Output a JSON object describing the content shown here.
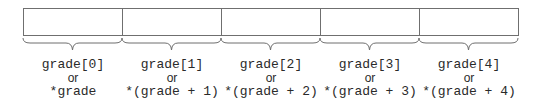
{
  "diagram": {
    "title": "",
    "array_name": "grade",
    "connector": "or",
    "cells": [
      {
        "index": 0,
        "subscript": "grade[0]",
        "pointer": "*grade"
      },
      {
        "index": 1,
        "subscript": "grade[1]",
        "pointer": "*(grade + 1)"
      },
      {
        "index": 2,
        "subscript": "grade[2]",
        "pointer": "*(grade + 2)"
      },
      {
        "index": 3,
        "subscript": "grade[3]",
        "pointer": "*(grade + 3)"
      },
      {
        "index": 4,
        "subscript": "grade[4]",
        "pointer": "*(grade + 4)"
      }
    ],
    "colors": {
      "stroke": "#6f6f6f",
      "text": "#2a2a2a",
      "background": "#ffffff"
    }
  }
}
